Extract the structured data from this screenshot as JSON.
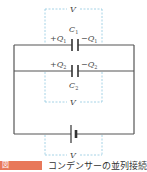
{
  "diagram": {
    "title": "コンデンサーの並列接続",
    "figure_label": "図",
    "labels": {
      "v_top": "V",
      "v_middle": "V",
      "v_bottom": "V",
      "c1": "C",
      "c1_sub": "1",
      "c2": "C",
      "c2_sub": "2",
      "q1_plus": "+Q",
      "q1_plus_sub": "1",
      "q1_minus": "−Q",
      "q1_minus_sub": "1",
      "q2_plus": "+Q",
      "q2_plus_sub": "2",
      "q2_minus": "−Q",
      "q2_minus_sub": "2"
    },
    "colors": {
      "wire": "#555555",
      "dashed": "#8fc8e0",
      "caption_label": "#e8785a"
    }
  }
}
